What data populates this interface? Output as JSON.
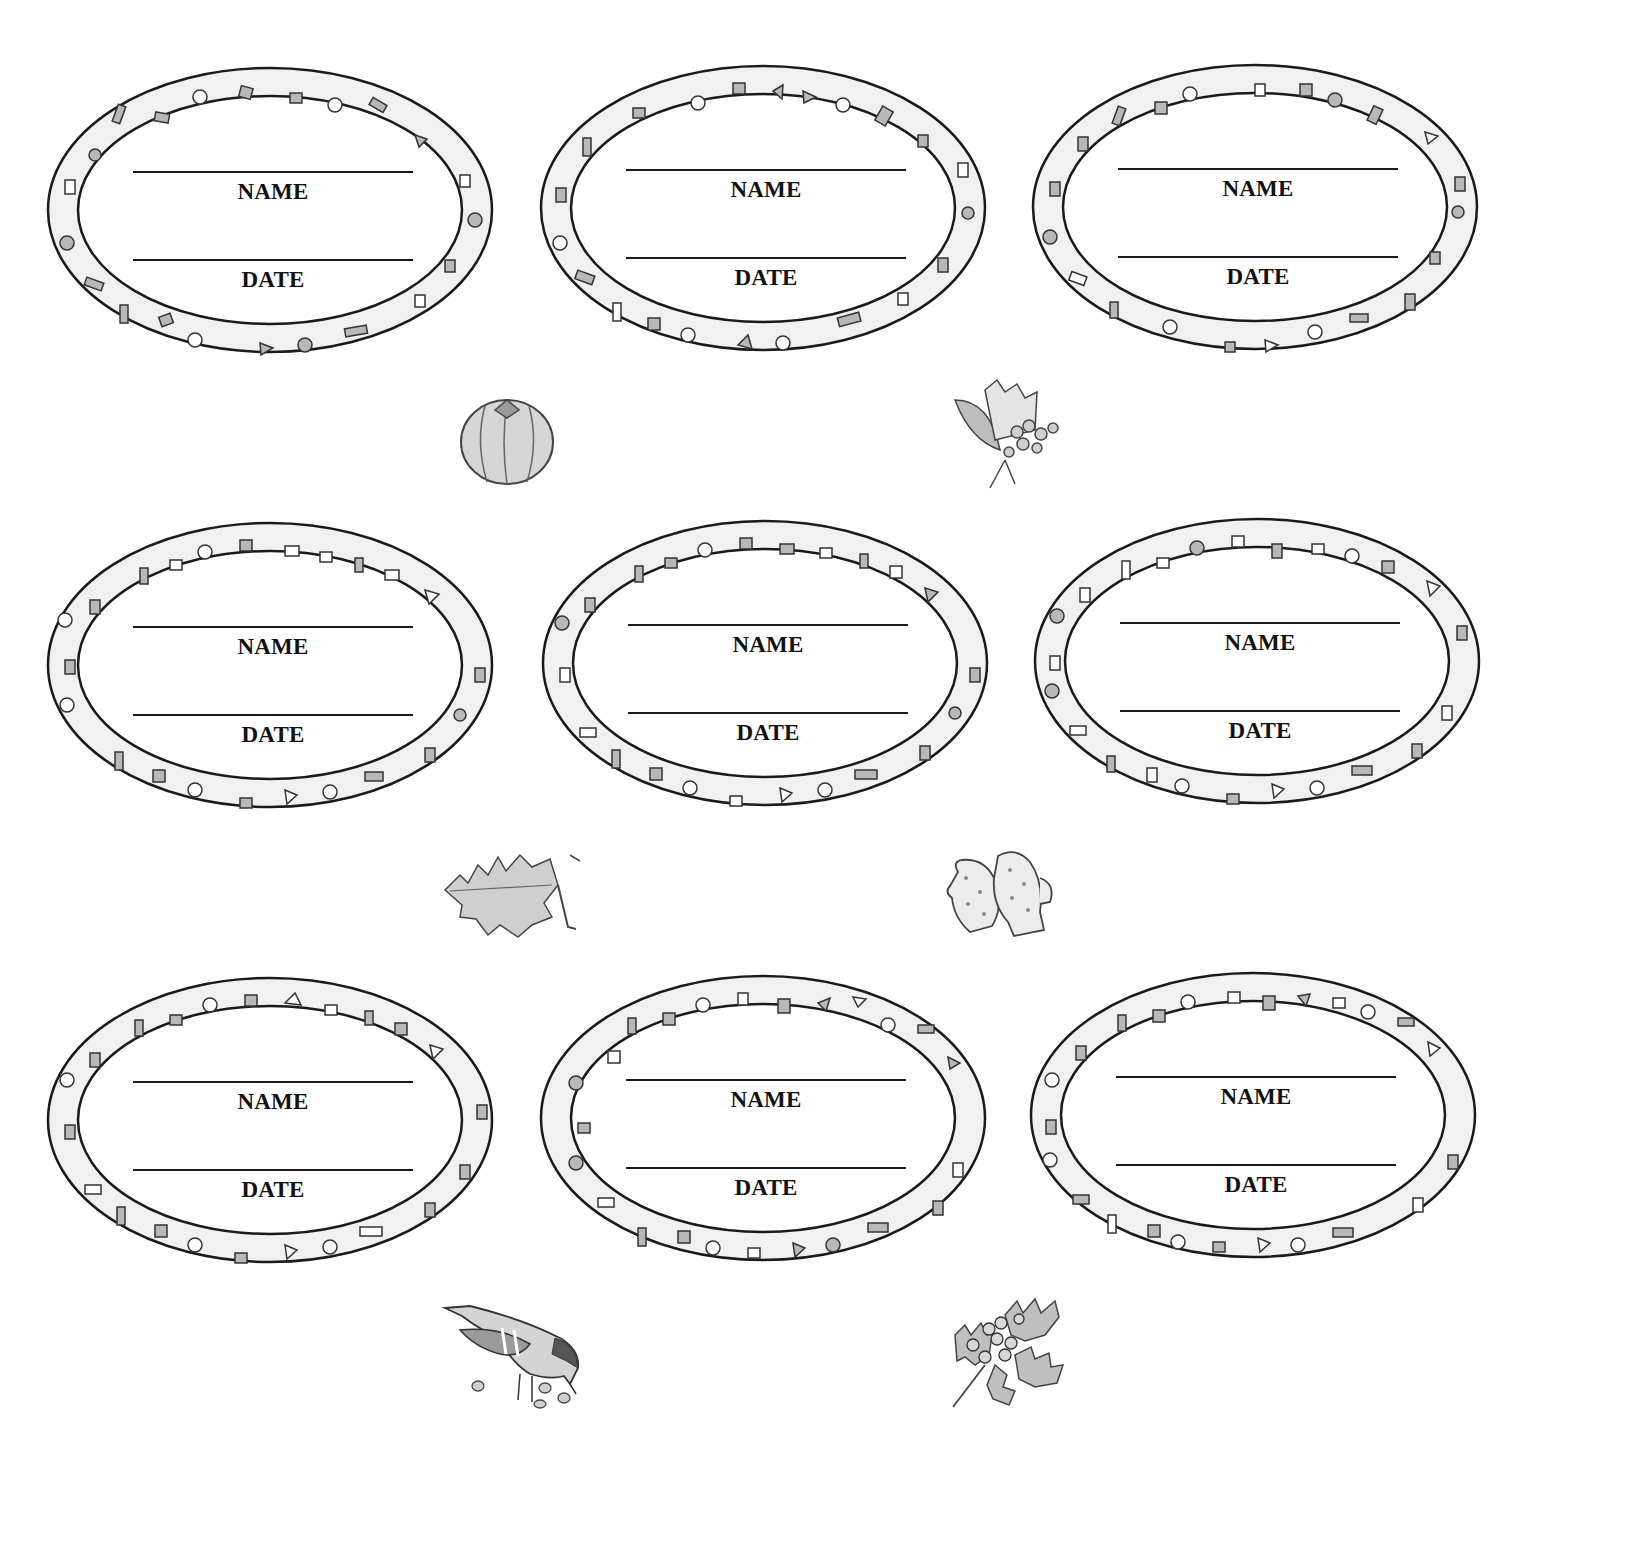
{
  "sheet": {
    "background": "#ffffff",
    "ink_color": "#1a1a1a",
    "border_fill": "#f1f1f1",
    "confetti_fill": "#b8b8b8"
  },
  "labels": [
    {
      "name_caption": "NAME",
      "date_caption": "DATE"
    },
    {
      "name_caption": "NAME",
      "date_caption": "DATE"
    },
    {
      "name_caption": "NAME",
      "date_caption": "DATE"
    },
    {
      "name_caption": "NAME",
      "date_caption": "DATE"
    },
    {
      "name_caption": "NAME",
      "date_caption": "DATE"
    },
    {
      "name_caption": "NAME",
      "date_caption": "DATE"
    },
    {
      "name_caption": "NAME",
      "date_caption": "DATE"
    },
    {
      "name_caption": "NAME",
      "date_caption": "DATE"
    },
    {
      "name_caption": "NAME",
      "date_caption": "DATE"
    }
  ],
  "illustrations": [
    {
      "icon": "pumpkin-icon"
    },
    {
      "icon": "autumn-berries-icon"
    },
    {
      "icon": "oak-leaf-icon"
    },
    {
      "icon": "mittens-icon"
    },
    {
      "icon": "bird-icon"
    },
    {
      "icon": "holly-icon"
    }
  ]
}
